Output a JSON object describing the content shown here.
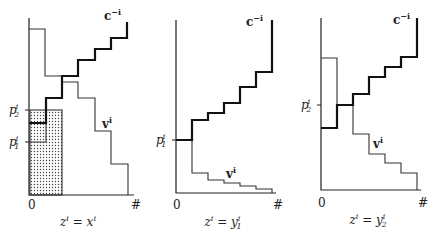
{
  "figure": {
    "panels": [
      {
        "id": "panel-1",
        "origin_label": "0",
        "end_label": "#",
        "caption": {
          "lhs": "z",
          "lhs_sup": "i",
          "eq": " = ",
          "rhs": "x",
          "rhs_sup": "i",
          "rhs_sub": ""
        },
        "c_label": {
          "main": "c",
          "sup": "−i"
        },
        "v_label": {
          "main": "v",
          "sup": "i"
        },
        "ticks": [
          {
            "label": "p",
            "sup": "i",
            "sub": "2",
            "y": 110
          },
          {
            "label": "p",
            "sup": "i",
            "sub": "1",
            "y": 142
          }
        ],
        "axis": {
          "x0": 29,
          "y_top": 18,
          "y_base": 195,
          "x_end": 134
        },
        "origin_pos": [
          28,
          209
        ],
        "end_pos": [
          131,
          209
        ],
        "caption_pos": [
          78,
          226
        ],
        "c_label_pos": [
          104,
          20
        ],
        "v_label_pos": [
          102,
          128
        ],
        "shaded": {
          "x": 30,
          "y": 110,
          "w": 32,
          "h": 85
        },
        "v_path": "M29,29 L45,29 L45,76 L62,76 L62,82 L78,82 L78,98 L95,98 L95,131 L111,131 L111,164 L128,164 L128,195",
        "v_inner_path": "M29,142 L46,142 L46,123",
        "c_path": "M29,123 L46,123 L46,98 L62,98 L62,76 L78,76 L78,60 L95,60 L95,49 L111,49 L111,38 L127,38 L127,22"
      },
      {
        "id": "panel-2",
        "origin_label": "0",
        "end_label": "#",
        "caption": {
          "lhs": "z",
          "lhs_sup": "i",
          "eq": " = ",
          "rhs": "y",
          "rhs_sup": "i",
          "rhs_sub": "1"
        },
        "c_label": {
          "main": "c",
          "sup": "−i"
        },
        "v_label": {
          "main": "v",
          "sup": "i"
        },
        "ticks": [
          {
            "label": "p",
            "sup": "i",
            "sub": "1",
            "y": 140
          }
        ],
        "axis": {
          "x0": 176,
          "y_top": 20,
          "y_base": 193,
          "x_end": 276
        },
        "origin_pos": [
          173,
          209
        ],
        "end_pos": [
          273,
          209
        ],
        "caption_pos": [
          223,
          226
        ],
        "c_label_pos": [
          246,
          26
        ],
        "v_label_pos": [
          226,
          178
        ],
        "shaded": null,
        "v_path": "M192,140 L192,173 L208,173 L208,180 L224,180 L224,183 L240,183 L240,186 L256,186 L256,189 L272,189 L272,193",
        "v_inner_path": "",
        "c_path": "M176,140 L192,140 L192,120 L208,120 L208,113 L224,113 L224,103 L240,103 L240,87 L256,87 L256,72 L272,72 L272,20"
      },
      {
        "id": "panel-3",
        "origin_label": "0",
        "end_label": "#",
        "caption": {
          "lhs": "z",
          "lhs_sup": "i",
          "eq": " = ",
          "rhs": "y",
          "rhs_sup": "i",
          "rhs_sub": "2"
        },
        "c_label": {
          "main": "c",
          "sup": "−i"
        },
        "v_label": {
          "main": "v",
          "sup": "i"
        },
        "ticks": [
          {
            "label": "p",
            "sup": "i",
            "sub": "2",
            "y": 105
          }
        ],
        "axis": {
          "x0": 321,
          "y_top": 18,
          "y_base": 190,
          "x_end": 421
        },
        "origin_pos": [
          318,
          207
        ],
        "end_pos": [
          418,
          207
        ],
        "caption_pos": [
          368,
          224
        ],
        "c_label_pos": [
          393,
          24
        ],
        "v_label_pos": [
          373,
          148
        ],
        "shaded": null,
        "v_path": "M321,58 L337,58 L337,105 L353,105 L353,134 L369,134 L369,154 L385,154 L385,163 L401,163 L401,173 L417,173 L417,190",
        "v_inner_path": "",
        "c_path": "M321,128 L337,128 L337,105 L353,105 L353,94 L369,94 L369,77 L385,77 L385,67 L401,67 L401,57 L417,57 L417,18"
      }
    ],
    "colors": {
      "ink": "#222222",
      "shade": "#555555",
      "background": "#ffffff"
    }
  }
}
